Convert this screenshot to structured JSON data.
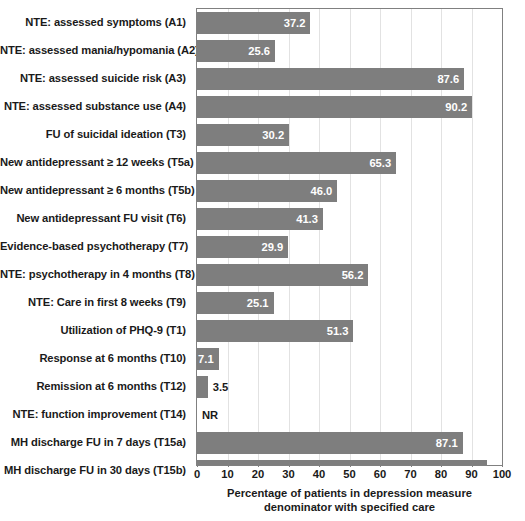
{
  "chart_data": {
    "type": "bar",
    "orientation": "horizontal",
    "title": "",
    "subtitle": "",
    "xlabel": "Percentage of patients in depression measure denominator with specified care",
    "xlabel_line1": "Percentage of patients in depression measure",
    "xlabel_line2": "denominator with specified care",
    "ylabel": "",
    "xlim": [
      0,
      100
    ],
    "xticks": [
      0,
      10,
      20,
      30,
      40,
      50,
      60,
      70,
      80,
      90,
      100
    ],
    "xticklabels": [
      "0",
      "10",
      "20",
      "30",
      "40",
      "50",
      "60",
      "70",
      "80",
      "90",
      "100"
    ],
    "grid": "vertical",
    "legend": "none",
    "bar_color": "#7e7e7e",
    "plot_border_color": "#808080",
    "gridline_color": "#e2e2e2",
    "categories": [
      "NTE: assessed symptoms (A1)",
      "NTE: assessed mania/hypomania (A2)",
      "NTE: assessed suicide risk (A3)",
      "NTE: assessed substance use (A4)",
      "FU of suicidal ideation (T3)",
      "New antidepressant ≥ 12 weeks (T5a)",
      "New antidepressant ≥ 6 months (T5b)",
      "New antidepressant FU visit (T6)",
      "Evidence-based psychotherapy (T7)",
      "NTE: psychotherapy in 4 months (T8)",
      "NTE: Care in first 8 weeks (T9)",
      "Utilization of PHQ-9 (T1)",
      "Response at 6 months (T10)",
      "Remission at 6 months (T12)",
      "NTE: function improvement (T14)",
      "MH discharge FU in 7 days (T15a)",
      "MH discharge FU in 30 days (T15b)"
    ],
    "values": [
      37.2,
      25.6,
      87.6,
      90.2,
      30.2,
      65.3,
      46.0,
      41.3,
      29.9,
      56.2,
      25.1,
      51.3,
      7.1,
      3.5,
      null,
      87.1,
      95.2
    ],
    "value_labels": [
      "37.2",
      "25.6",
      "87.6",
      "90.2",
      "30.2",
      "65.3",
      "46.0",
      "41.3",
      "29.9",
      "56.2",
      "25.1",
      "51.3",
      "7.1",
      "3.5",
      "NR",
      "87.1",
      "95.2"
    ],
    "label_placement": [
      "inside",
      "inside",
      "inside",
      "inside",
      "inside",
      "inside",
      "inside",
      "inside",
      "inside",
      "inside",
      "inside",
      "inside",
      "inside",
      "outside",
      "outside",
      "inside",
      "inside"
    ]
  }
}
